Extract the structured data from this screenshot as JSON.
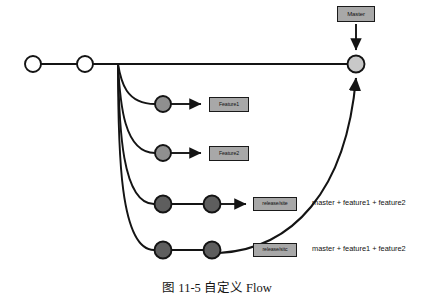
{
  "figure": {
    "caption": "图 11-5   自定义 Flow",
    "width": 434,
    "height": 302
  },
  "colors": {
    "line": "#141414",
    "box_fill": "#a8a8a8",
    "box_border": "#1a1a1a",
    "commit_open": "#ffffff",
    "commit_master_merge": "#c8c8c8",
    "commit_feature": "#8f8f8f",
    "commit_release": "#5e5e5e",
    "text": "#111111",
    "background": "#ffffff"
  },
  "branches": {
    "master": {
      "name": "master",
      "label": "Master",
      "commits": [
        {
          "name": "master-commit-1",
          "cx": 33,
          "cy": 64,
          "r": 8,
          "style": "open"
        },
        {
          "name": "master-commit-2",
          "cx": 85,
          "cy": 64,
          "r": 8,
          "style": "open"
        },
        {
          "name": "master-merge-commit",
          "cx": 356,
          "cy": 64,
          "r": 8.5,
          "style": "merge"
        }
      ]
    },
    "feature1": {
      "name": "feature1",
      "label": "Feature1",
      "commits": [
        {
          "name": "feature1-commit-1",
          "cx": 163,
          "cy": 104,
          "r": 8,
          "style": "feature"
        }
      ]
    },
    "feature2": {
      "name": "feature2",
      "label": "Feature2",
      "commits": [
        {
          "name": "feature2-commit-1",
          "cx": 163,
          "cy": 153,
          "r": 8,
          "style": "feature"
        }
      ]
    },
    "release1": {
      "name": "release1",
      "label": "release/site",
      "note": "master + feature1 + feature2",
      "commits": [
        {
          "name": "release1-commit-1",
          "cx": 163,
          "cy": 204,
          "r": 8.5,
          "style": "release"
        },
        {
          "name": "release1-commit-2",
          "cx": 212,
          "cy": 204,
          "r": 8.5,
          "style": "release"
        }
      ]
    },
    "release2": {
      "name": "release2",
      "label": "release/sitc",
      "note": "master + feature1 + feature2",
      "commits": [
        {
          "name": "release2-commit-1",
          "cx": 163,
          "cy": 250,
          "r": 8.5,
          "style": "release"
        },
        {
          "name": "release2-commit-2",
          "cx": 212,
          "cy": 250,
          "r": 8.5,
          "style": "release"
        }
      ]
    }
  },
  "edges": {
    "master_trunk": "M 41 64 L 77 64 M 93 64 L 348 64",
    "branch_point_x": 118,
    "branch_point_y": 64,
    "fork_feature1": "M 118 64 C 121 82, 126 104, 155 104",
    "fork_feature2": "M 118 64 C 120 104, 124 153, 155 153",
    "fork_release1": "M 118 64 C 119 128, 122 204, 154 204",
    "fork_release2": "M 118 64 C 118 152, 120 250, 154 250",
    "feature1_arrow": "M 171 104 L 203 104",
    "feature2_arrow": "M 171 153 L 203 153",
    "release1_line": "M 172 204 L 204 204",
    "release1_arrow": "M 221 204 L 248 204",
    "release2_line": "M 172 250 L 204 250",
    "merge_to_master": "M 221 252 C 290 250, 345 190, 356 76",
    "master_label_arrow": "M 356 24 L 356 52"
  },
  "icons": {
    "arrowhead": "arrow-head-icon"
  }
}
